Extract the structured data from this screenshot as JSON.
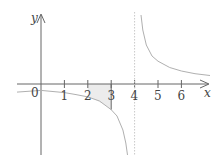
{
  "diagram": {
    "type": "function-graph",
    "function": "y = k/(x - 4), hyperbola with vertical asymptote x = 4",
    "x_axis_label": "x",
    "y_axis_label": "y",
    "origin_label": "0",
    "x_ticks": [
      "1",
      "2",
      "3",
      "4",
      "5",
      "6"
    ],
    "asymptote_x": 4,
    "shaded_region": {
      "from": 2,
      "to": 3,
      "description": "area between curve and x-axis"
    },
    "colors": {
      "axis": "#666666",
      "curve": "#b0b0b0",
      "asymptote": "#c8c8c8",
      "shade": "#ececec"
    }
  }
}
